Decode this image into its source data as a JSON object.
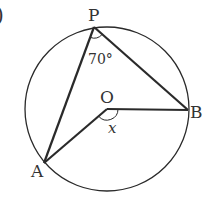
{
  "diagram": {
    "type": "circle-geometry",
    "colors": {
      "stroke": "#2a2a2a",
      "text": "#333333",
      "background": "#ffffff"
    },
    "circle": {
      "center": "O"
    },
    "points": [
      {
        "name": "P",
        "label": "P"
      },
      {
        "name": "B",
        "label": "B"
      },
      {
        "name": "O",
        "label": "O"
      },
      {
        "name": "A",
        "label": "A"
      }
    ],
    "segments": [
      "PA",
      "PB",
      "OA",
      "OB"
    ],
    "angles": [
      {
        "vertex": "P",
        "between": "A-P-B",
        "label": "70°"
      },
      {
        "vertex": "O",
        "between": "A-O-B",
        "label": "x"
      }
    ],
    "corner_mark": ")"
  }
}
